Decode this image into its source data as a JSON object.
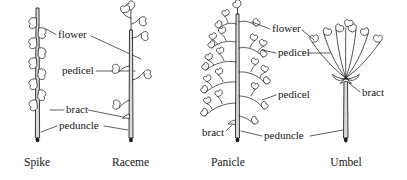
{
  "figure": {
    "background": "#ffffff",
    "ink": "#1a1a1a",
    "stem_fill": "#d9d9d9"
  },
  "labels": {
    "flower_left": "flower",
    "pedicel_left": "pedicel",
    "bract_left": "bract",
    "peduncle_left": "peduncle",
    "flower_right": "flower",
    "pedicel_right_upper": "pedicel",
    "pedicel_right_lower": "pedicel",
    "bract_panicle": "bract",
    "bract_umbel": "bract",
    "peduncle_right": "peduncle"
  },
  "captions": {
    "spike": "Spike",
    "raceme": "Raceme",
    "panicle": "Panicle",
    "umbel": "Umbel"
  },
  "diagrams": [
    {
      "name": "spike",
      "caption": "Spike",
      "description": "Unbranched axis with sessile flowers attached directly to the peduncle",
      "flower_count": 9,
      "has_pedicels": false,
      "parts": [
        "flower",
        "bract",
        "peduncle"
      ]
    },
    {
      "name": "raceme",
      "caption": "Raceme",
      "description": "Unbranched axis with flowers borne on short pedicels",
      "flower_count": 6,
      "has_pedicels": true,
      "parts": [
        "flower",
        "pedicel",
        "bract",
        "peduncle"
      ]
    },
    {
      "name": "panicle",
      "caption": "Panicle",
      "description": "Branched axis; each branch bears pedicellate flowers",
      "flower_count": 26,
      "branch_count": 10,
      "has_pedicels": true,
      "parts": [
        "flower",
        "pedicel",
        "bract",
        "peduncle"
      ]
    },
    {
      "name": "umbel",
      "caption": "Umbel",
      "description": "Pedicels of equal length radiating from a single point atop the peduncle",
      "flower_count": 7,
      "pedicel_count": 7,
      "has_pedicels": true,
      "parts": [
        "flower",
        "pedicel",
        "bract",
        "peduncle"
      ]
    }
  ]
}
